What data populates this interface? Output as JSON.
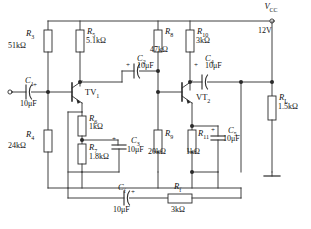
{
  "diagram": {
    "type": "two-stage-rc-coupled-transistor-amplifier",
    "supply": {
      "symbol": "V",
      "symbol_sub": "CC",
      "value": "12V"
    },
    "ground": {
      "name": "ground-symbol"
    }
  },
  "resistors": [
    {
      "ref": "R",
      "sub": "3",
      "value": "51kΩ",
      "role": "upper-bias-divider-stage1"
    },
    {
      "ref": "R",
      "sub": "4",
      "value": "24kΩ",
      "role": "lower-bias-divider-stage1"
    },
    {
      "ref": "R",
      "sub": "5",
      "value": "5.1kΩ",
      "role": "collector-stage1"
    },
    {
      "ref": "R",
      "sub": "6",
      "value": "1kΩ",
      "role": "emitter-upper-stage1"
    },
    {
      "ref": "R",
      "sub": "7",
      "value": "1.8kΩ",
      "role": "emitter-lower-stage1"
    },
    {
      "ref": "R",
      "sub": "8",
      "value": "47kΩ",
      "role": "upper-bias-divider-stage2"
    },
    {
      "ref": "R",
      "sub": "9",
      "value": "20kΩ",
      "role": "lower-bias-divider-stage2"
    },
    {
      "ref": "R",
      "sub": "10",
      "value": "3kΩ",
      "role": "collector-stage2"
    },
    {
      "ref": "R",
      "sub": "11",
      "value": "1kΩ",
      "role": "emitter-stage2"
    },
    {
      "ref": "R",
      "sub": "f",
      "value": "3kΩ",
      "role": "feedback-resistor"
    },
    {
      "ref": "R",
      "sub": "L",
      "value": "1.5kΩ",
      "role": "load-resistor"
    }
  ],
  "capacitors": [
    {
      "ref": "C",
      "sub": "1",
      "value": "10μF",
      "polarity": "+",
      "role": "input-coupling"
    },
    {
      "ref": "C",
      "sub": "2",
      "value": "10μF",
      "polarity": "+",
      "role": "interstage-coupling"
    },
    {
      "ref": "C",
      "sub": "3",
      "value": "10μF",
      "polarity": "+",
      "role": "emitter-bypass-stage1"
    },
    {
      "ref": "C",
      "sub": "4",
      "value": "10μF",
      "polarity": "+",
      "role": "output-coupling"
    },
    {
      "ref": "C",
      "sub": "5",
      "value": "10μF",
      "polarity": "+",
      "role": "emitter-bypass-stage2"
    },
    {
      "ref": "C",
      "sub": "f",
      "value": "10μF",
      "polarity": "+",
      "role": "feedback-coupling"
    }
  ],
  "transistors": [
    {
      "ref": "TV",
      "sub": "1",
      "role": "first-stage-npn"
    },
    {
      "ref": "VT",
      "sub": "2",
      "role": "second-stage-npn"
    }
  ],
  "terminals": [
    {
      "name": "input-terminal"
    },
    {
      "name": "supply-terminal"
    }
  ]
}
